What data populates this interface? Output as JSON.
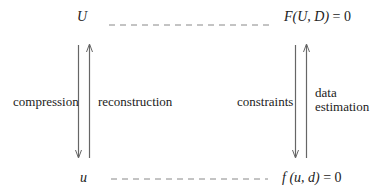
{
  "diagram": {
    "top_left": "U",
    "top_right_lhs": "F(U, D)",
    "top_right_rhs": "= 0",
    "bottom_left": "u",
    "bottom_right_lhs": "f (u, d)",
    "bottom_right_rhs": "= 0",
    "left_down_label": "compression",
    "left_up_label": "reconstruction",
    "right_down_label": "constraints",
    "right_up_label_line1": "data",
    "right_up_label_line2": "estimation"
  },
  "colors": {
    "ink": "#222222",
    "arrow": "#666666",
    "dash": "#888888"
  }
}
